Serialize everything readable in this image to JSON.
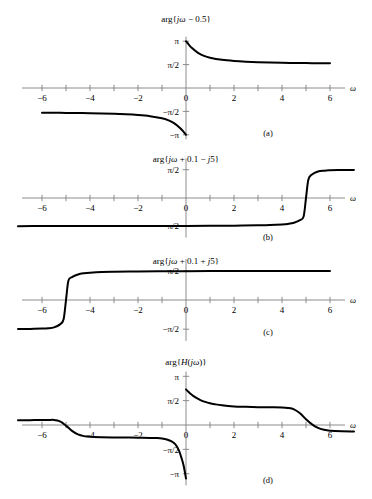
{
  "figure": {
    "xlabel": "ω",
    "panels": [
      {
        "id": "a",
        "panel_label": "(a)",
        "title": "arg{ jω − 0.5 }",
        "title_parts": {
          "prefix": "arg{",
          "italic": "jω",
          "suffix": " − 0.5}"
        },
        "xticks": [
          -6,
          -5,
          -4,
          -3,
          -2,
          -1,
          0,
          1,
          2,
          3,
          4,
          5,
          6
        ],
        "xtick_labels": [
          {
            "value": -6,
            "text": "−6"
          },
          {
            "value": -4,
            "text": "−4"
          },
          {
            "value": -2,
            "text": "−2"
          },
          {
            "value": 0,
            "text": "0"
          },
          {
            "value": 2,
            "text": "2"
          },
          {
            "value": 4,
            "text": "4"
          },
          {
            "value": 6,
            "text": "6"
          }
        ],
        "yticks": [
          {
            "value": 3.14159,
            "text": "π"
          },
          {
            "value": 1.5708,
            "text": "π/2"
          },
          {
            "value": -1.5708,
            "text": "−π/2"
          },
          {
            "value": -3.14159,
            "text": "−π"
          }
        ],
        "ylim": [
          -3.45,
          3.45
        ],
        "xlim": [
          -7.2,
          7.2
        ]
      },
      {
        "id": "b",
        "panel_label": "(b)",
        "title": "arg{ jω + 0.1 − j5 }",
        "title_parts": {
          "prefix": "arg{",
          "italic": "jω",
          "suffix": " + 0.1 − ",
          "italic2": "j",
          "suffix2": "5}"
        },
        "xticks": [
          -6,
          -5,
          -4,
          -3,
          -2,
          -1,
          0,
          1,
          2,
          3,
          4,
          5,
          6
        ],
        "xtick_labels": [
          {
            "value": -6,
            "text": "−6"
          },
          {
            "value": -4,
            "text": "−4"
          },
          {
            "value": -2,
            "text": "−2"
          },
          {
            "value": 0,
            "text": "0"
          },
          {
            "value": 2,
            "text": "2"
          },
          {
            "value": 4,
            "text": "4"
          },
          {
            "value": 6,
            "text": "6"
          }
        ],
        "yticks": [
          {
            "value": 1.5708,
            "text": "π/2"
          },
          {
            "value": -1.5708,
            "text": "−π/2"
          }
        ],
        "ylim": [
          -2.2,
          2.2
        ],
        "xlim": [
          -7.2,
          7.2
        ]
      },
      {
        "id": "c",
        "panel_label": "(c)",
        "title": "arg{ jω + 0.1 + j5 }",
        "title_parts": {
          "prefix": "arg{",
          "italic": "jω",
          "suffix": " + 0.1 + ",
          "italic2": "j",
          "suffix2": "5}"
        },
        "xticks": [
          -6,
          -5,
          -4,
          -3,
          -2,
          -1,
          0,
          1,
          2,
          3,
          4,
          5,
          6
        ],
        "xtick_labels": [
          {
            "value": -6,
            "text": "−6"
          },
          {
            "value": -4,
            "text": "−4"
          },
          {
            "value": -2,
            "text": "−2"
          },
          {
            "value": 0,
            "text": "0"
          },
          {
            "value": 2,
            "text": "2"
          },
          {
            "value": 4,
            "text": "4"
          },
          {
            "value": 6,
            "text": "6"
          }
        ],
        "yticks": [
          {
            "value": 1.5708,
            "text": "π/2"
          },
          {
            "value": -1.5708,
            "text": "−π/2"
          }
        ],
        "ylim": [
          -2.2,
          2.2
        ],
        "xlim": [
          -7.2,
          7.2
        ]
      },
      {
        "id": "d",
        "panel_label": "(d)",
        "title": "arg{ H( jω ) }",
        "title_parts": {
          "prefix": "arg{",
          "italic": "H",
          "suffix": "(",
          "italic2": "jω",
          "suffix2": ")}"
        },
        "xticks": [
          -6,
          -5,
          -4,
          -3,
          -2,
          -1,
          0,
          1,
          2,
          3,
          4,
          5,
          6
        ],
        "xtick_labels": [
          {
            "value": -6,
            "text": "−6"
          },
          {
            "value": -4,
            "text": "−4"
          },
          {
            "value": -2,
            "text": "−2"
          },
          {
            "value": 0,
            "text": "0"
          },
          {
            "value": 2,
            "text": "2"
          },
          {
            "value": 4,
            "text": "4"
          },
          {
            "value": 6,
            "text": "6"
          }
        ],
        "yticks": [
          {
            "value": 3.14159,
            "text": "π"
          },
          {
            "value": 1.5708,
            "text": "π/2"
          },
          {
            "value": -1.5708,
            "text": "−π/2"
          },
          {
            "value": -3.14159,
            "text": "−π"
          }
        ],
        "ylim": [
          -3.9,
          3.45
        ],
        "xlim": [
          -7.2,
          7.2
        ]
      }
    ]
  },
  "chart_data": [
    {
      "type": "line",
      "title": "arg{ jω − 0.5 }",
      "panel": "(a)",
      "xlabel": "ω",
      "ylabel": "",
      "xlim": [
        -7.2,
        7.2
      ],
      "ylim": [
        -3.45,
        3.45
      ],
      "grid": false,
      "legend": "none",
      "description": "Phase of (jω − 0.5); branch cut at ω = 0. For ω>0 it falls from π toward π/2; for ω<0 it rises from −π toward −π/2.",
      "series": [
        {
          "name": "positive-branch",
          "x": [
            0.0,
            0.1,
            0.25,
            0.5,
            0.75,
            1.0,
            1.5,
            2.0,
            2.5,
            3.0,
            3.5,
            4.0,
            4.5,
            5.0,
            5.5,
            6.0
          ],
          "values": [
            3.1416,
            2.9442,
            2.6779,
            2.3562,
            2.1588,
            2.0344,
            1.8925,
            1.8158,
            1.7682,
            1.7359,
            1.7127,
            1.6952,
            1.6815,
            1.6705,
            1.6614,
            1.6539
          ]
        },
        {
          "name": "negative-branch",
          "x": [
            -6.0,
            -5.5,
            -5.0,
            -4.5,
            -4.0,
            -3.5,
            -3.0,
            -2.5,
            -2.0,
            -1.5,
            -1.0,
            -0.75,
            -0.5,
            -0.25,
            -0.1,
            0.0
          ],
          "values": [
            -1.6539,
            -1.6614,
            -1.6705,
            -1.6815,
            -1.6952,
            -1.7127,
            -1.7359,
            -1.7682,
            -1.8158,
            -1.8925,
            -2.0344,
            -2.1588,
            -2.3562,
            -2.6779,
            -2.9442,
            -3.1416
          ]
        }
      ]
    },
    {
      "type": "line",
      "title": "arg{ jω + 0.1 − j5 }",
      "panel": "(b)",
      "xlabel": "ω",
      "ylabel": "",
      "xlim": [
        -7.2,
        7.2
      ],
      "ylim": [
        -2.2,
        2.2
      ],
      "grid": false,
      "legend": "none",
      "description": "Phase of (0.1 + j(ω − 5)): −π/2 for ω ≪ 5, rises through 0 at ω = 5, then +π/2 for ω ≫ 5.",
      "series": [
        {
          "name": "phase",
          "x": [
            -7.0,
            -6.0,
            -5.0,
            -4.0,
            -3.0,
            -2.0,
            -1.0,
            0.0,
            1.0,
            2.0,
            3.0,
            3.5,
            4.0,
            4.25,
            4.5,
            4.75,
            4.9,
            5.0,
            5.1,
            5.25,
            5.5,
            5.75,
            6.0,
            6.5,
            7.0
          ],
          "values": [
            -1.5625,
            -1.5617,
            -1.5608,
            -1.5597,
            -1.5583,
            -1.5565,
            -1.5541,
            -1.5508,
            -1.5458,
            -1.5375,
            -1.5208,
            -1.506,
            -1.4711,
            -1.4382,
            -1.3734,
            -1.2315,
            -1.0304,
            0.0,
            1.0304,
            1.3101,
            1.4711,
            1.5208,
            1.5375,
            1.5541,
            1.5625
          ]
        }
      ]
    },
    {
      "type": "line",
      "title": "arg{ jω + 0.1 + j5 }",
      "panel": "(c)",
      "xlabel": "ω",
      "ylabel": "",
      "xlim": [
        -7.2,
        7.2
      ],
      "ylim": [
        -2.2,
        2.2
      ],
      "grid": false,
      "legend": "none",
      "description": "Phase of (0.1 + j(ω + 5)): −π/2 for ω ≪ −5, rises through 0 at ω = −5, then +π/2 for ω ≫ −5.",
      "series": [
        {
          "name": "phase",
          "x": [
            -7.0,
            -6.5,
            -6.0,
            -5.75,
            -5.5,
            -5.25,
            -5.1,
            -5.0,
            -4.9,
            -4.75,
            -4.5,
            -4.25,
            -4.0,
            -3.5,
            -3.0,
            -2.0,
            -1.0,
            0.0,
            1.0,
            2.0,
            3.0,
            4.0,
            5.0,
            6.0
          ],
          "values": [
            -1.5625,
            -1.5541,
            -1.5375,
            -1.5208,
            -1.4711,
            -1.3101,
            -1.0304,
            0.0,
            1.0304,
            1.2315,
            1.3734,
            1.4382,
            1.4711,
            1.506,
            1.5208,
            1.5375,
            1.5458,
            1.5508,
            1.5541,
            1.5565,
            1.5583,
            1.5597,
            1.5608,
            1.5617
          ]
        }
      ]
    },
    {
      "type": "line",
      "title": "arg{ H( jω ) }",
      "panel": "(d)",
      "xlabel": "ω",
      "ylabel": "",
      "xlim": [
        -7.2,
        7.2
      ],
      "ylim": [
        -3.9,
        3.45
      ],
      "grid": false,
      "legend": "none",
      "description": "Total phase = (a) + (b) + (c) wrapped; two S-shaped drops near ω = ±5 and a branch discontinuity at ω = 0.",
      "series": [
        {
          "name": "left-branch",
          "x": [
            -7.0,
            -6.5,
            -6.0,
            -5.75,
            -5.5,
            -5.25,
            -5.0,
            -4.75,
            -4.5,
            -4.25,
            -4.0,
            -3.5,
            -3.0,
            -2.5,
            -2.0,
            -1.5,
            -1.2,
            -1.0,
            -0.8,
            -0.6,
            -0.45,
            -0.3,
            -0.2,
            -0.1,
            0.0
          ],
          "values": [
            0.3125,
            0.3141,
            0.3166,
            0.3194,
            0.327,
            0.234,
            -0.04,
            -0.38,
            -0.61,
            -0.718,
            -0.765,
            -0.79,
            -0.802,
            -0.81,
            -0.818,
            -0.831,
            -0.843,
            -0.87,
            -0.93,
            -1.05,
            -1.24,
            -1.62,
            -2.07,
            -2.61,
            -3.45
          ]
        },
        {
          "name": "right-branch",
          "x": [
            0.0,
            0.1,
            0.2,
            0.3,
            0.45,
            0.6,
            0.8,
            1.0,
            1.2,
            1.5,
            2.0,
            2.5,
            3.0,
            3.5,
            4.0,
            4.25,
            4.5,
            4.75,
            5.0,
            5.25,
            5.5,
            5.75,
            6.0,
            6.5,
            7.0
          ],
          "values": [
            2.3,
            2.14,
            2.0,
            1.88,
            1.73,
            1.61,
            1.49,
            1.4,
            1.34,
            1.27,
            1.2,
            1.17,
            1.15,
            1.14,
            1.13,
            1.1,
            1.01,
            0.76,
            0.37,
            0.04,
            -0.19,
            -0.31,
            -0.37,
            -0.41,
            -0.42
          ]
        }
      ]
    }
  ]
}
